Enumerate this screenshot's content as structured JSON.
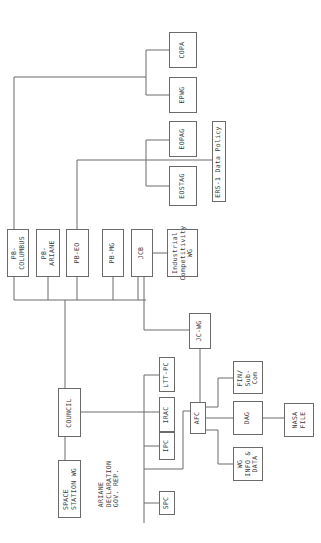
{
  "diagram": {
    "orientation": "rotated-90-ccw",
    "line_color": "#6a6a6a",
    "text_color": "#3a3a3a",
    "nodes": [
      {
        "id": "copa",
        "label": "COPA",
        "x": 169,
        "y": 32,
        "w": 28,
        "h": 36
      },
      {
        "id": "epwg",
        "label": "EPWG",
        "x": 169,
        "y": 77,
        "w": 28,
        "h": 36
      },
      {
        "id": "eopag",
        "label": "EOPAG",
        "x": 169,
        "y": 121,
        "w": 28,
        "h": 36
      },
      {
        "id": "eostag",
        "label": "EOSTAG",
        "x": 169,
        "y": 166,
        "w": 28,
        "h": 40
      },
      {
        "id": "ers1",
        "label": "ERS-1 Data Policy",
        "x": 212,
        "y": 121,
        "w": 14,
        "h": 81
      },
      {
        "id": "pb_columbus",
        "label": "PB-\nCOLUMBUS",
        "x": 7,
        "y": 229,
        "w": 22,
        "h": 48
      },
      {
        "id": "pb_ariane",
        "label": "PB-\nARIANE",
        "x": 36,
        "y": 229,
        "w": 24,
        "h": 48
      },
      {
        "id": "pb_eo",
        "label": "PB-EO",
        "x": 66,
        "y": 229,
        "w": 23,
        "h": 48
      },
      {
        "id": "pb_mg",
        "label": "PB-MG",
        "x": 102,
        "y": 229,
        "w": 22,
        "h": 48
      },
      {
        "id": "jcb",
        "label": "JCB",
        "x": 131,
        "y": 229,
        "w": 22,
        "h": 48
      },
      {
        "id": "industrial_wg",
        "label": "Industrial\nCompetitivity\nWG",
        "x": 167,
        "y": 229,
        "w": 31,
        "h": 48
      },
      {
        "id": "jc_wg",
        "label": "JC-WG",
        "x": 189,
        "y": 313,
        "w": 22,
        "h": 36
      },
      {
        "id": "council",
        "label": "COUNCIL",
        "x": 58,
        "y": 388,
        "w": 23,
        "h": 49
      },
      {
        "id": "space_station_wg",
        "label": "SPACE\nSTATION WG",
        "x": 58,
        "y": 460,
        "w": 23,
        "h": 58
      },
      {
        "id": "ariane_declaration",
        "label": "ARIANE\nDECLARATION\nGOV. REP.",
        "x": 95,
        "y": 456,
        "w": 28,
        "h": 56,
        "border": false
      },
      {
        "id": "ltt_pc",
        "label": "LTT-PC",
        "x": 159,
        "y": 357,
        "w": 16,
        "h": 35
      },
      {
        "id": "irac",
        "label": "IRAC",
        "x": 159,
        "y": 397,
        "w": 16,
        "h": 35
      },
      {
        "id": "ipc",
        "label": "IPC",
        "x": 159,
        "y": 432,
        "w": 16,
        "h": 28
      },
      {
        "id": "spc",
        "label": "SPC",
        "x": 159,
        "y": 491,
        "w": 16,
        "h": 24
      },
      {
        "id": "afc",
        "label": "AFC",
        "x": 190,
        "y": 402,
        "w": 16,
        "h": 32
      },
      {
        "id": "fin_sub_com",
        "label": "FIN/\nSub-\nCom",
        "x": 233,
        "y": 361,
        "w": 30,
        "h": 33
      },
      {
        "id": "dag",
        "label": "DAG",
        "x": 233,
        "y": 401,
        "w": 30,
        "h": 34
      },
      {
        "id": "wg_info_data",
        "label": "WG\nINFO &\nDATA",
        "x": 233,
        "y": 447,
        "w": 30,
        "h": 34
      },
      {
        "id": "nasa_file",
        "label": "NASA\nFILE",
        "x": 284,
        "y": 403,
        "w": 30,
        "h": 34
      }
    ],
    "connectors": [
      "14,277 14,300 146,300",
      "48,277 48,300",
      "77,277 77,300",
      "113,277 113,300",
      "138,277 138,300",
      "65,300 65,388",
      "14,229 14,77 146,77",
      "146,50 146,95",
      "146,50 169,50",
      "146,95 169,95",
      "77,229 77,160 212,160",
      "146,140 146,186",
      "146,140 169,140",
      "146,186 169,186",
      "144,277 144,330 189,330",
      "153,253 167,253",
      "200,349 200,402",
      "65,437 65,460",
      "81,412 144,412",
      "144,375 144,523",
      "144,375 159,375",
      "144,412 159,412",
      "144,446 159,446",
      "144,503 159,503",
      "144,469 183,469 183,411 190,411",
      "206,407 218,407 218,378 233,378",
      "206,418 233,418",
      "206,430 218,430 218,464 233,464",
      "263,418 284,418"
    ]
  }
}
